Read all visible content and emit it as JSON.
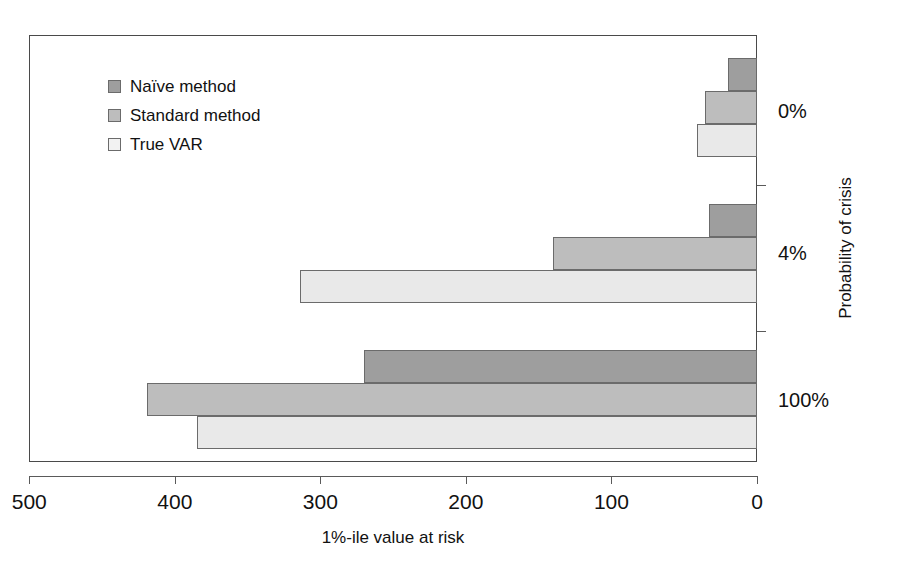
{
  "chart_data": {
    "type": "bar",
    "orientation": "horizontal",
    "title": "",
    "xlabel": "1%-ile value at risk",
    "ylabel": "Probability of crisis",
    "categories": [
      "0%",
      "4%",
      "100%"
    ],
    "series": [
      {
        "name": "Naïve method",
        "color": "#9e9e9e",
        "values": [
          20,
          33,
          270
        ]
      },
      {
        "name": "Standard method",
        "color": "#bdbdbd",
        "values": [
          36,
          140,
          419
        ]
      },
      {
        "name": "True VAR",
        "color": "#e9e9e9",
        "values": [
          41,
          314,
          385
        ]
      }
    ],
    "xlim": [
      500,
      0
    ],
    "xticks": [
      500,
      400,
      300,
      200,
      100,
      0
    ],
    "xtick_labels": [
      "500",
      "400",
      "300",
      "200",
      "100",
      "0"
    ],
    "x_axis_reversed": true,
    "grid": false,
    "legend_position": "top-left",
    "legend_entries": [
      "Naïve method",
      "Standard method",
      "True VAR"
    ]
  },
  "axes": {
    "x_title": "1%-ile value at risk",
    "y_title": "Probability of crisis",
    "x_tick_labels": [
      "500",
      "400",
      "300",
      "200",
      "100",
      "0"
    ],
    "y_tick_labels": [
      "0%",
      "4%",
      "100%"
    ]
  },
  "legend": {
    "items": [
      {
        "label": "Naïve method",
        "swatch": "#9e9e9e"
      },
      {
        "label": "Standard method",
        "swatch": "#bdbdbd"
      },
      {
        "label": "True VAR",
        "swatch": "#f2f2f2"
      }
    ]
  }
}
